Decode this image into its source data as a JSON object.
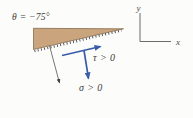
{
  "figure": {
    "angle_label": "θ = −75°",
    "axes": {
      "x_label": "x",
      "y_label": "y"
    },
    "labels": {
      "shear": "τ > 0",
      "normal": "σ > 0"
    },
    "colors": {
      "wedge_fill": "#C9A47D",
      "hatch": "#4a4a4a",
      "arrow_blue": "#3A5BA8",
      "thin_arrow": "#3c3c3c",
      "axis_line": "#5a5a5a"
    }
  }
}
